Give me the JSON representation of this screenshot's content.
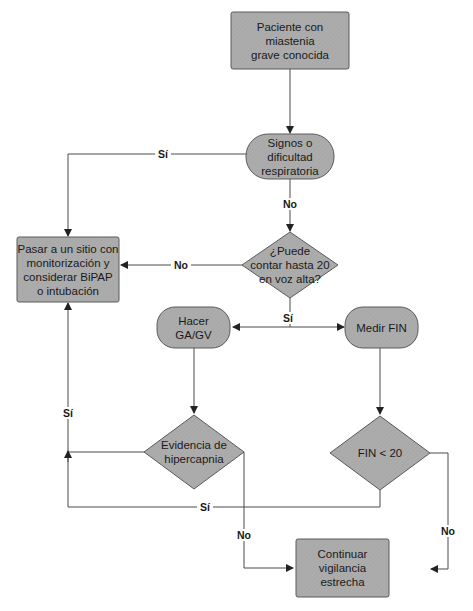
{
  "colors": {
    "node_fill": "#a9a9a9",
    "node_stroke": "#5a5a5a",
    "line": "#4a4a4a",
    "background": "#ffffff"
  },
  "nodes": {
    "start": {
      "text": "Paciente con miastenia\ngrave conocida",
      "shape": "rectangle"
    },
    "signos": {
      "text": "Signos o\ndificultad\nrespiratoria",
      "shape": "rounded"
    },
    "contar": {
      "text": "¿Puede\ncontar hasta 20\nen voz alta?",
      "shape": "diamond"
    },
    "pasar": {
      "text": "Pasar a un sitio con\nmonitorización y\nconsiderar BiPAP\no intubación",
      "shape": "rectangle"
    },
    "hacer_ga": {
      "text": "Hacer\nGA/GV",
      "shape": "rounded"
    },
    "medir_fin": {
      "text": "Medir FIN",
      "shape": "rounded"
    },
    "hipercapnia": {
      "text": "Evidencia de\nhipercapnia",
      "shape": "diamond"
    },
    "fin20": {
      "text": "FIN < 20",
      "shape": "diamond"
    },
    "continuar": {
      "text": "Continuar\nvigilancia\nestrecha",
      "shape": "rectangle"
    }
  },
  "edges": {
    "signos_si": "Sí",
    "signos_no": "No",
    "contar_no": "No",
    "contar_si": "Sí",
    "hipercapnia_si": "Sí",
    "fin20_si": "Sí",
    "hipercapnia_no": "No",
    "fin20_no": "No"
  }
}
